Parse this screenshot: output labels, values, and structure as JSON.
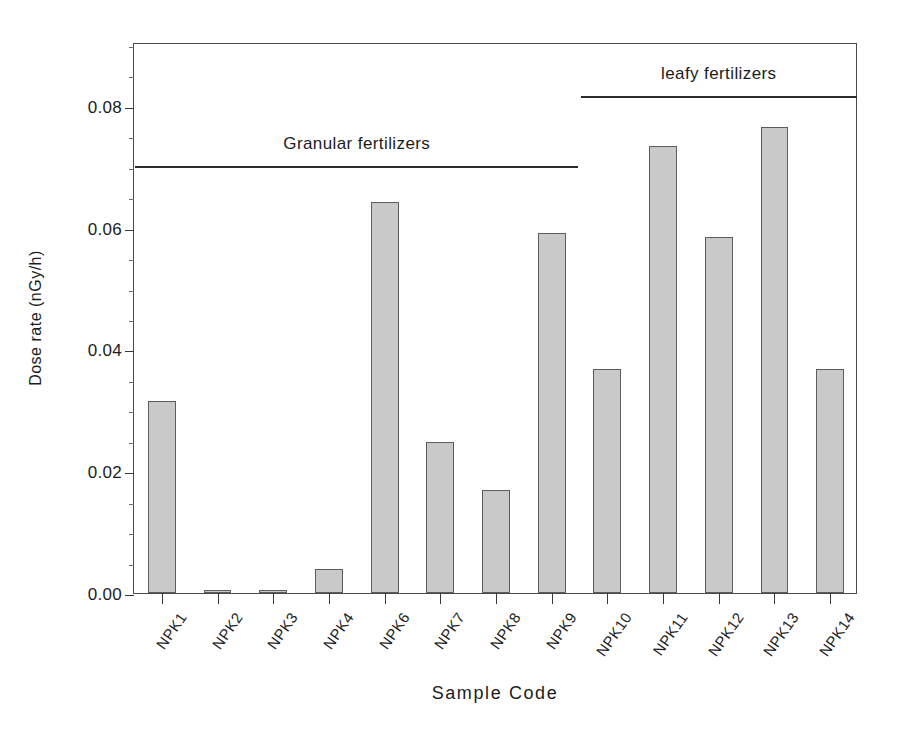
{
  "chart_data": {
    "type": "bar",
    "title": "",
    "xlabel": "Sample Code",
    "ylabel": "Dose rate (nGy/h)",
    "categories": [
      "NPK1",
      "NPK2",
      "NPK3",
      "NPK4",
      "NPK6",
      "NPK7",
      "NPK8",
      "NPK9",
      "NPK10",
      "NPK11",
      "NPK12",
      "NPK13",
      "NPK14"
    ],
    "values": [
      0.0315,
      0.0005,
      0.0005,
      0.004,
      0.0643,
      0.0248,
      0.017,
      0.0592,
      0.0368,
      0.0735,
      0.0585,
      0.0766,
      0.0368
    ],
    "ylim": [
      0.0,
      0.0905
    ],
    "xlim_note": "categorical",
    "yticks": [
      0.0,
      0.02,
      0.04,
      0.06,
      0.08
    ],
    "ytick_labels": [
      "0.00",
      "0.02",
      "0.04",
      "0.06",
      "0.08"
    ],
    "yminor_step": 0.005,
    "grid": false,
    "legend": "none",
    "bar_fill_color": "#c9c9c9",
    "bar_edge_color": "#5c5c5c",
    "axis_color": "#4a4a4a",
    "text_color": "#1c1c1c",
    "annotations": [
      {
        "label": "Granular fertilizers",
        "covers": [
          "NPK1",
          "NPK2",
          "NPK3",
          "NPK4",
          "NPK6",
          "NPK7",
          "NPK8",
          "NPK9"
        ],
        "line_y_value": 0.0705,
        "line_x_start_index": 0,
        "line_x_end_index": 7
      },
      {
        "label": "leafy fertilizers",
        "covers": [
          "NPK10",
          "NPK11",
          "NPK12",
          "NPK13",
          "NPK14"
        ],
        "line_y_value": 0.0819,
        "line_x_start_index": 8,
        "line_x_end_index": 12
      }
    ]
  }
}
